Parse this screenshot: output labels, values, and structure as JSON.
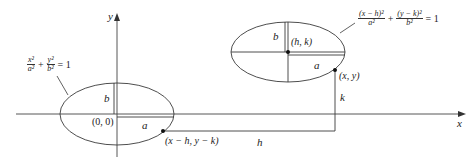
{
  "diagram": {
    "axes": {
      "x_label": "x",
      "y_label": "y"
    },
    "origin_ellipse": {
      "center_label": "(0, 0)",
      "a_label": "a",
      "b_label": "b",
      "equation": {
        "t1_num": "x²",
        "t1_den": "a²",
        "plus": "+",
        "t2_num": "y²",
        "t2_den": "b²",
        "rhs": "= 1"
      }
    },
    "shifted_ellipse": {
      "center_label": "(h, k)",
      "a_label": "a",
      "b_label": "b",
      "equation": {
        "t1_num": "(x − h)²",
        "t1_den": "a²",
        "plus": "+",
        "t2_num": "(y − k)²",
        "t2_den": "b²",
        "rhs": "= 1"
      }
    },
    "points": {
      "xy": "(x, y)",
      "translated": "(x − h, y − k)"
    },
    "offsets": {
      "h_label": "h",
      "k_label": "k"
    },
    "colors": {
      "stroke": "#3a3a3a",
      "axis": "#444444",
      "text": "#222222"
    }
  }
}
